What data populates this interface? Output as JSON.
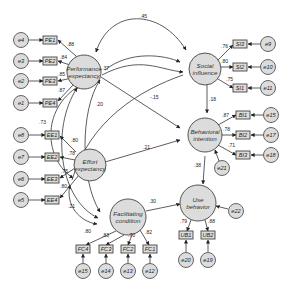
{
  "diagram": {
    "type": "structural-equation-model",
    "latents": {
      "pe": {
        "line1": "Performance",
        "line2": "expectancy"
      },
      "ee": {
        "line1": "Effort",
        "line2": "expectancy"
      },
      "si": {
        "line1": "Social",
        "line2": "influence"
      },
      "bi": {
        "line1": "Behavioral",
        "line2": "intention"
      },
      "fc": {
        "line1": "Facilitating",
        "line2": "condition"
      },
      "ub": {
        "line1": "Use",
        "line2": "behavior"
      }
    },
    "indicators": {
      "pe": [
        {
          "label": "PE1",
          "error": "e4",
          "loading": ".88"
        },
        {
          "label": "PE2",
          "error": "e3",
          "loading": ".84"
        },
        {
          "label": "PE3",
          "error": "e2",
          "loading": ".85"
        },
        {
          "label": "PE4",
          "error": "e1",
          "loading": ".87"
        }
      ],
      "ee": [
        {
          "label": "EE1",
          "error": "e8",
          "loading": ".80"
        },
        {
          "label": "EE2",
          "error": "e7",
          "loading": ".78"
        },
        {
          "label": "EE3",
          "error": "e6",
          "loading": ".75"
        },
        {
          "label": "EE4",
          "error": "e5",
          "loading": ".80"
        }
      ],
      "si": [
        {
          "label": "SI3",
          "error": "e9",
          "loading": ".76"
        },
        {
          "label": "SI2",
          "error": "e10",
          "loading": ".80"
        },
        {
          "label": "SI1",
          "error": "e11",
          "loading": ".75"
        }
      ],
      "bi": [
        {
          "label": "BI1",
          "error": "e15",
          "loading": ".87"
        },
        {
          "label": "BI2",
          "error": "e17",
          "loading": ".78"
        },
        {
          "label": "BI3",
          "error": "e18",
          "loading": ".71"
        }
      ],
      "fc": [
        {
          "label": "FC4",
          "error": "e15",
          "loading": ".80"
        },
        {
          "label": "FC3",
          "error": "e14",
          "loading": ".83"
        },
        {
          "label": "FC2",
          "error": "e13",
          "loading": ".70"
        },
        {
          "label": "FC1",
          "error": "e12",
          "loading": ".82"
        }
      ],
      "ub": [
        {
          "label": "UB1",
          "error": "e20",
          "loading": ".79"
        },
        {
          "label": "UB2",
          "error": "e19",
          "loading": ".88"
        }
      ]
    },
    "disturbances": {
      "bi": "e21",
      "ub": "e22"
    },
    "paths": {
      "pe_bi": "-.15",
      "ee_bi": ".21",
      "si_bi": ".18",
      "bi_ub": ".38",
      "fc_ub": ".30"
    },
    "covariances": {
      "pe_si": ".45",
      "pe_ee_outer": ".73",
      "pe_fc": ".20",
      "pe_si_inner": ".37",
      "ee_fc": ".21"
    }
  }
}
